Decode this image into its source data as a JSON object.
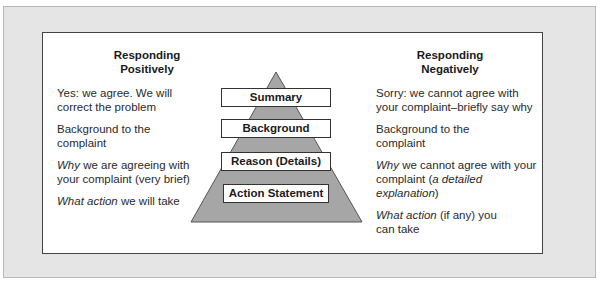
{
  "left_column": {
    "heading_line1": "Responding",
    "heading_line2": "Positively",
    "items": [
      {
        "italic": "",
        "line1": "Yes: we agree. We will",
        "line2": "correct the problem"
      },
      {
        "italic": "",
        "line1": "Background to the",
        "line2": "complaint"
      },
      {
        "italic": "Why",
        "line1": " we are agreeing with",
        "line2": "your complaint (very brief)"
      },
      {
        "italic": "What action",
        "line1": " we will take",
        "line2": ""
      }
    ]
  },
  "right_column": {
    "heading_line1": "Responding",
    "heading_line2": "Negatively",
    "items": [
      {
        "italic": "",
        "line1": "Sorry: we cannot agree with",
        "line2": "your complaint–briefly say why"
      },
      {
        "italic": "",
        "line1": "Background to the",
        "line2": "complaint"
      },
      {
        "italic": "Why",
        "line1": " we cannot agree with your",
        "line2_pre": "complaint (",
        "line2_italic": "a detailed explanation",
        "line2_post": ")"
      },
      {
        "italic": "What action",
        "line1": " (if any) you",
        "line2": "can take"
      }
    ]
  },
  "pyramid": {
    "fill_color": "#a6a6a6",
    "levels": [
      {
        "label": "Summary"
      },
      {
        "label": "Background"
      },
      {
        "label": "Reason (Details)"
      },
      {
        "label": "Action Statement"
      }
    ]
  }
}
